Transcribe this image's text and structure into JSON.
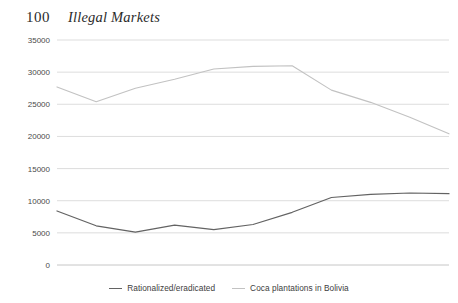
{
  "header": {
    "page_number": "100",
    "running_head": "Illegal Markets"
  },
  "chart_data": {
    "type": "line",
    "title": "",
    "subtitle": "",
    "xlabel": "",
    "ylabel": "",
    "categories": [
      "2004",
      "2005",
      "2006",
      "2007",
      "2008",
      "2009",
      "2010",
      "2011",
      "2012",
      "2013",
      "2014"
    ],
    "series": [
      {
        "name": "Rationalized/eradicated",
        "color": "#636363",
        "values": [
          8400,
          6100,
          5100,
          6200,
          5500,
          6300,
          8200,
          10500,
          11000,
          11200,
          11100
        ]
      },
      {
        "name": "Coca plantations in Bolivia",
        "color": "#c2c2c2",
        "values": [
          27700,
          25400,
          27500,
          28900,
          30500,
          30900,
          31000,
          27200,
          25300,
          23000,
          20400
        ]
      }
    ],
    "ylim": [
      0,
      35000
    ],
    "yticks": [
      0,
      5000,
      10000,
      15000,
      20000,
      25000,
      30000,
      35000
    ],
    "ytick_labels": [
      "0",
      "5000",
      "10000",
      "15000",
      "20000",
      "25000",
      "30000",
      "35000"
    ],
    "grid": true,
    "legend_position": "bottom",
    "legend": [
      "Rationalized/eradicated",
      "Coca plantations in Bolivia"
    ]
  },
  "colors": {
    "grid": "#d9d9d9",
    "axis": "#bfbfbf",
    "text": "#4a4a4a",
    "series_dark": "#636363",
    "series_light": "#c2c2c2",
    "background": "#ffffff"
  }
}
